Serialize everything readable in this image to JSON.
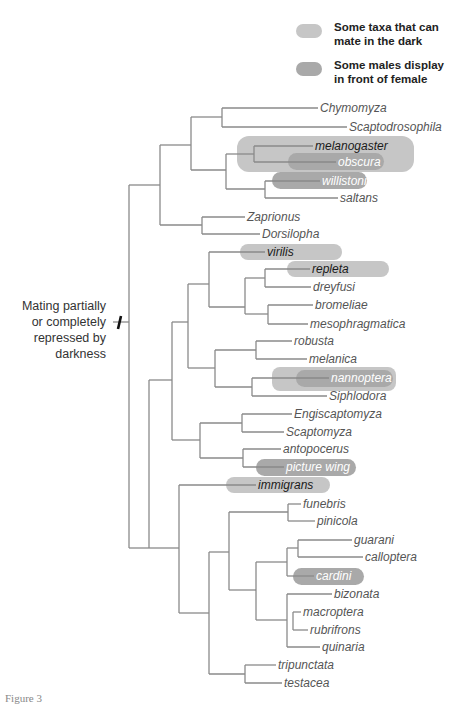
{
  "legend": {
    "items": [
      {
        "label": "Some taxa that can mate in the dark",
        "line1": "Some taxa that can",
        "line2": "mate in the dark",
        "color": "#c6c6c6"
      },
      {
        "label": "Some males display in front of female",
        "line1": "Some males display",
        "line2": "in front of female",
        "color": "#a9a9a9"
      }
    ]
  },
  "annotation": {
    "lines": [
      "Mating partially",
      "or completely",
      "repressed by",
      "darkness"
    ]
  },
  "figure_label": "Figure 3",
  "colors": {
    "branch": "#8a8a8a",
    "light_highlight": "#c6c6c6",
    "dark_highlight": "#a9a9a9",
    "label_text": "#555555",
    "label_text_dark": "#1a1a1a",
    "label_text_on_dark": "#ffffff"
  },
  "taxa": [
    {
      "name": "Chymomyza",
      "y": 108,
      "x": 318,
      "hl": null
    },
    {
      "name": "Scaptodrosophila",
      "y": 127,
      "x": 347,
      "hl": null
    },
    {
      "name": "melanogaster",
      "y": 146,
      "x": 313,
      "hl": "dark-text"
    },
    {
      "name": "obscura",
      "y": 162,
      "x": 336,
      "hl": "white-text"
    },
    {
      "name": "willistoni",
      "y": 181,
      "x": 320,
      "hl": "white-text"
    },
    {
      "name": "saltans",
      "y": 198,
      "x": 338,
      "hl": null
    },
    {
      "name": "Zaprionus",
      "y": 217,
      "x": 245,
      "hl": null
    },
    {
      "name": "Dorsilopha",
      "y": 234,
      "x": 260,
      "hl": null
    },
    {
      "name": "virilis",
      "y": 252,
      "x": 265,
      "hl": "dark-text"
    },
    {
      "name": "repleta",
      "y": 269,
      "x": 310,
      "hl": "dark-text"
    },
    {
      "name": "dreyfusi",
      "y": 287,
      "x": 311,
      "hl": null
    },
    {
      "name": "bromeliae",
      "y": 305,
      "x": 313,
      "hl": null
    },
    {
      "name": "mesophragmatica",
      "y": 324,
      "x": 308,
      "hl": null
    },
    {
      "name": "robusta",
      "y": 341,
      "x": 292,
      "hl": null
    },
    {
      "name": "melanica",
      "y": 359,
      "x": 307,
      "hl": null
    },
    {
      "name": "nannoptera",
      "y": 378,
      "x": 329,
      "hl": "white-text"
    },
    {
      "name": "Siphlodora",
      "y": 396,
      "x": 327,
      "hl": null
    },
    {
      "name": "Engiscaptomyza",
      "y": 414,
      "x": 292,
      "hl": null
    },
    {
      "name": "Scaptomyza",
      "y": 432,
      "x": 284,
      "hl": null
    },
    {
      "name": "antopocerus",
      "y": 449,
      "x": 281,
      "hl": null
    },
    {
      "name": "picture wing",
      "y": 467,
      "x": 284,
      "hl": "white-text"
    },
    {
      "name": "immigrans",
      "y": 485,
      "x": 256,
      "hl": "dark-text"
    },
    {
      "name": "funebris",
      "y": 504,
      "x": 301,
      "hl": null
    },
    {
      "name": "pinicola",
      "y": 521,
      "x": 315,
      "hl": null
    },
    {
      "name": "guarani",
      "y": 540,
      "x": 352,
      "hl": null
    },
    {
      "name": "calloptera",
      "y": 557,
      "x": 363,
      "hl": null
    },
    {
      "name": "cardini",
      "y": 576,
      "x": 314,
      "hl": "white-text"
    },
    {
      "name": "bizonata",
      "y": 594,
      "x": 332,
      "hl": null
    },
    {
      "name": "macroptera",
      "y": 612,
      "x": 301,
      "hl": null
    },
    {
      "name": "rubrifrons",
      "y": 630,
      "x": 308,
      "hl": null
    },
    {
      "name": "quinaria",
      "y": 647,
      "x": 320,
      "hl": null
    },
    {
      "name": "tripunctata",
      "y": 665,
      "x": 276,
      "hl": null
    },
    {
      "name": "testacea",
      "y": 683,
      "x": 282,
      "hl": null
    }
  ]
}
